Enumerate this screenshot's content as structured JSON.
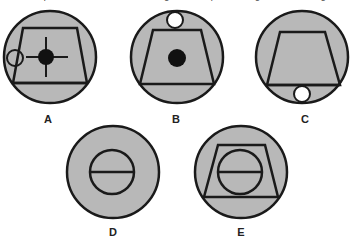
{
  "caption_fragment": "... the option which is a mirror image of the question figure in the diagram",
  "figures": [
    {
      "label": "A",
      "contents": [
        "trapezoid",
        "filled dot with crosshair",
        "small open circle on left edge"
      ]
    },
    {
      "label": "B",
      "contents": [
        "trapezoid",
        "filled dot",
        "small open circle on top"
      ]
    },
    {
      "label": "C",
      "contents": [
        "trapezoid",
        "small open circle below base"
      ]
    },
    {
      "label": "D",
      "contents": [
        "circle divided by horizontal line"
      ]
    },
    {
      "label": "E",
      "contents": [
        "trapezoid",
        "circle divided by horizontal line"
      ]
    }
  ],
  "colors": {
    "fill": "#b8b8b8",
    "stroke": "#1a1a1a",
    "background": "#ffffff"
  }
}
